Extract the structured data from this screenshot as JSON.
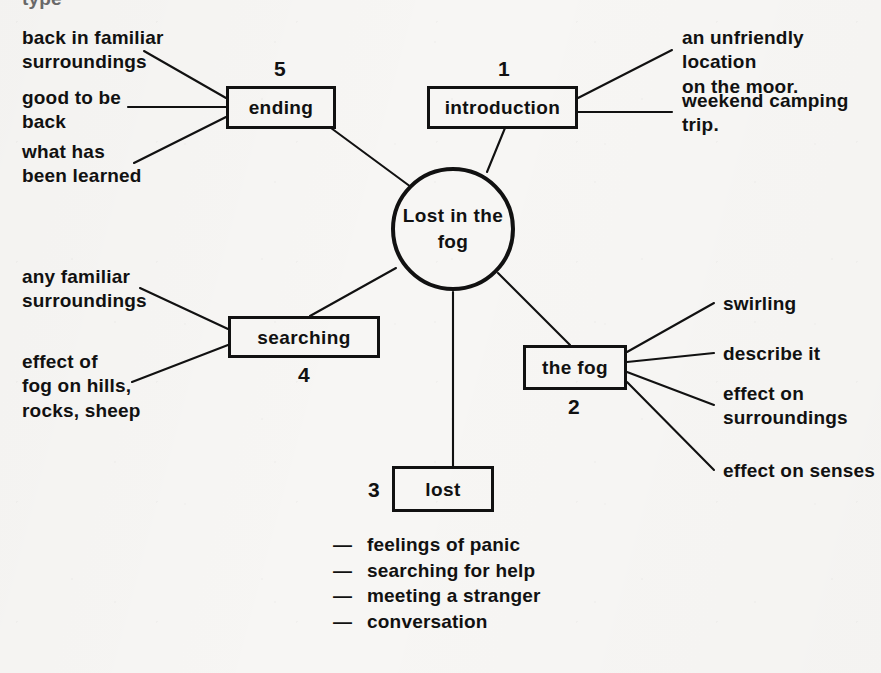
{
  "diagram": {
    "type": "mind-map",
    "title_cut_off": "type",
    "center": {
      "label": "Lost in\nthe fog",
      "shape": "circle"
    },
    "nodes": [
      {
        "id": "introduction",
        "label": "introduction",
        "number": "1"
      },
      {
        "id": "the-fog",
        "label": "the fog",
        "number": "2"
      },
      {
        "id": "lost",
        "label": "lost",
        "number": "3"
      },
      {
        "id": "searching",
        "label": "searching",
        "number": "4"
      },
      {
        "id": "ending",
        "label": "ending",
        "number": "5"
      }
    ],
    "leaves": {
      "ending": [
        "back in familiar\nsurroundings",
        "good to be\nback",
        "what has\nbeen learned"
      ],
      "introduction": [
        "an unfriendly location\non the moor.",
        "weekend camping\ntrip."
      ],
      "searching": [
        "any familiar\nsurroundings",
        "effect of\nfog on hills,\nrocks, sheep"
      ],
      "the_fog": [
        "swirling",
        "describe it",
        "effect on\nsurroundings",
        "effect on senses"
      ],
      "lost_bullets": [
        "feelings of panic",
        "searching for help",
        "meeting a stranger",
        "conversation"
      ]
    },
    "bullet_marker": "—",
    "colors": {
      "ink": "#111111",
      "paper": "#f7f6f4"
    }
  }
}
